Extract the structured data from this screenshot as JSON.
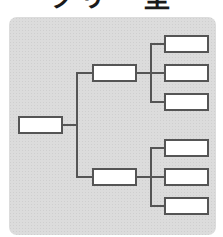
{
  "title": "ツリー型",
  "colors": {
    "panel": "#dcdcdc",
    "line": "#555555",
    "box_fill": "#ffffff"
  },
  "tree": {
    "root": {
      "label": ""
    },
    "branches": [
      {
        "label": "",
        "leaves": [
          {
            "label": ""
          },
          {
            "label": ""
          },
          {
            "label": ""
          }
        ]
      },
      {
        "label": "",
        "leaves": [
          {
            "label": ""
          },
          {
            "label": ""
          },
          {
            "label": ""
          }
        ]
      }
    ]
  }
}
